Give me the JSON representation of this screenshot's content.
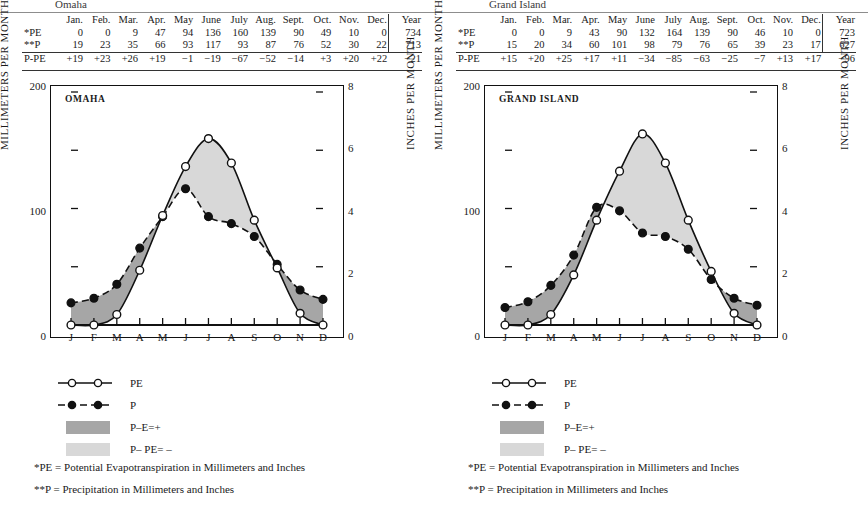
{
  "page": {
    "background": "#ffffff",
    "series_colors": {
      "pe_line": "#111111",
      "p_line": "#111111",
      "surplus_fill": "#a6a6a6",
      "deficit_fill": "#d8d8d8"
    }
  },
  "legend": {
    "items": [
      {
        "key": "pe-line-key",
        "label": "PE"
      },
      {
        "key": "p-line-key",
        "label": "P"
      },
      {
        "key": "surplus-swatch",
        "label": "P–E=+"
      },
      {
        "key": "deficit-swatch",
        "label": "P– PE= –"
      }
    ],
    "notes": [
      "*PE = Potential Evapotranspiration in Millimeters and Inches",
      "**P = Precipitation in Millimeters and Inches"
    ]
  },
  "table": {
    "columns": [
      "Jan.",
      "Feb.",
      "Mar.",
      "Apr.",
      "May",
      "June",
      "July",
      "Aug.",
      "Sept.",
      "Oct.",
      "Nov.",
      "Dec.",
      "Year"
    ],
    "row_labels": [
      "*PE",
      "**P",
      "P-PE"
    ]
  },
  "panels": [
    {
      "caption": "Omaha",
      "chart_title": "OMAHA",
      "table_rows": {
        "pe": [
          "0",
          "0",
          "9",
          "47",
          "94",
          "136",
          "160",
          "139",
          "90",
          "49",
          "10",
          "0",
          "734"
        ],
        "p": [
          "19",
          "23",
          "35",
          "66",
          "93",
          "117",
          "93",
          "87",
          "76",
          "52",
          "30",
          "22",
          "713"
        ],
        "ppe": [
          "+19",
          "+23",
          "+26",
          "+19",
          "−1",
          "−19",
          "−67",
          "−52",
          "−14",
          "+3",
          "+20",
          "+22",
          "−21"
        ]
      }
    },
    {
      "caption": "Grand Island",
      "chart_title": "GRAND ISLAND",
      "table_rows": {
        "pe": [
          "0",
          "0",
          "9",
          "43",
          "90",
          "132",
          "164",
          "139",
          "90",
          "46",
          "10",
          "0",
          "723"
        ],
        "p": [
          "15",
          "20",
          "34",
          "60",
          "101",
          "98",
          "79",
          "76",
          "65",
          "39",
          "23",
          "17",
          "627"
        ],
        "ppe": [
          "+15",
          "+20",
          "+25",
          "+17",
          "+11",
          "−34",
          "−85",
          "−63",
          "−25",
          "−7",
          "+13",
          "+17",
          "−96"
        ]
      }
    }
  ],
  "chart_data": [
    {
      "type": "line",
      "title": "OMAHA",
      "xlabel": "",
      "ylabel": "MILLIMETERS PER MONTH",
      "ylabel_right": "INCHES PER MONTH",
      "categories": [
        "J",
        "F",
        "M",
        "A",
        "M",
        "J",
        "J",
        "A",
        "S",
        "O",
        "N",
        "D"
      ],
      "month_names": [
        "Jan.",
        "Feb.",
        "Mar.",
        "Apr.",
        "May",
        "June",
        "July",
        "Aug.",
        "Sept.",
        "Oct.",
        "Nov.",
        "Dec."
      ],
      "series": [
        {
          "name": "PE",
          "marker": "open-circle",
          "linestyle": "solid",
          "values": [
            0,
            0,
            9,
            47,
            94,
            136,
            160,
            139,
            90,
            49,
            10,
            0
          ],
          "annual_total": 734
        },
        {
          "name": "P",
          "marker": "filled-circle",
          "linestyle": "dashed",
          "values": [
            19,
            23,
            35,
            66,
            93,
            117,
            93,
            87,
            76,
            52,
            30,
            22
          ],
          "annual_total": 713
        }
      ],
      "difference": {
        "name": "P-PE",
        "values": [
          19,
          23,
          26,
          19,
          -1,
          -19,
          -67,
          -52,
          -14,
          3,
          20,
          22
        ],
        "annual_total": -21
      },
      "ylim": [
        0,
        200
      ],
      "yticks": [
        0,
        100,
        200
      ],
      "yminor": [
        50,
        150
      ],
      "ylim_right": [
        0,
        8
      ],
      "yticks_right": [
        0,
        2,
        4,
        6,
        8
      ],
      "grid": false,
      "legend_position": "below",
      "fills": [
        {
          "name": "P–E=+",
          "color": "#a6a6a6",
          "where": "P greater than PE"
        },
        {
          "name": "P– PE= –",
          "color": "#d8d8d8",
          "where": "PE greater than P"
        }
      ]
    },
    {
      "type": "line",
      "title": "GRAND ISLAND",
      "xlabel": "",
      "ylabel": "MILLIMETERS PER MONTH",
      "ylabel_right": "INCHES PER MONTH",
      "categories": [
        "J",
        "F",
        "M",
        "A",
        "M",
        "J",
        "J",
        "A",
        "S",
        "O",
        "N",
        "D"
      ],
      "month_names": [
        "Jan.",
        "Feb.",
        "Mar.",
        "Apr.",
        "May",
        "June",
        "July",
        "Aug.",
        "Sept.",
        "Oct.",
        "Nov.",
        "Dec."
      ],
      "series": [
        {
          "name": "PE",
          "marker": "open-circle",
          "linestyle": "solid",
          "values": [
            0,
            0,
            9,
            43,
            90,
            132,
            164,
            139,
            90,
            46,
            10,
            0
          ],
          "annual_total": 723
        },
        {
          "name": "P",
          "marker": "filled-circle",
          "linestyle": "dashed",
          "values": [
            15,
            20,
            34,
            60,
            101,
            98,
            79,
            76,
            65,
            39,
            23,
            17
          ],
          "annual_total": 627
        }
      ],
      "difference": {
        "name": "P-PE",
        "values": [
          15,
          20,
          25,
          17,
          11,
          -34,
          -85,
          -63,
          -25,
          -7,
          13,
          17
        ],
        "annual_total": -96
      },
      "ylim": [
        0,
        200
      ],
      "yticks": [
        0,
        100,
        200
      ],
      "yminor": [
        50,
        150
      ],
      "ylim_right": [
        0,
        8
      ],
      "yticks_right": [
        0,
        2,
        4,
        6,
        8
      ],
      "grid": false,
      "legend_position": "below",
      "fills": [
        {
          "name": "P–E=+",
          "color": "#a6a6a6",
          "where": "P greater than PE"
        },
        {
          "name": "P– PE= –",
          "color": "#d8d8d8",
          "where": "PE greater than P"
        }
      ]
    }
  ]
}
